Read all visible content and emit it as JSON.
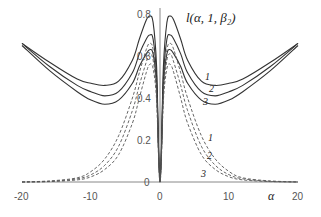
{
  "chart_data": {
    "type": "line",
    "xlabel": "α",
    "ylabel": "",
    "xlim": [
      -20,
      20
    ],
    "ylim": [
      0,
      0.8
    ],
    "x_ticks": [
      "-20",
      "-10",
      "0",
      "10",
      "20"
    ],
    "y_ticks": [
      "0",
      "0.2",
      "0.4",
      "0.6",
      "0.8"
    ],
    "grid": false,
    "legend": "inline curve numbers 1, 2, 3",
    "x": [
      -20,
      -16,
      -12,
      -10,
      -8,
      -6,
      -4,
      -3,
      -2,
      -1.5,
      -1,
      -0.5,
      0,
      0.5,
      1,
      1.5,
      2,
      3,
      4,
      6,
      8,
      10,
      12,
      16,
      20
    ],
    "series": [
      {
        "name": "1",
        "style": "solid",
        "values": [
          0.66,
          0.57,
          0.49,
          0.47,
          0.46,
          0.48,
          0.58,
          0.68,
          0.77,
          0.79,
          0.76,
          0.55,
          0.0,
          0.55,
          0.76,
          0.79,
          0.77,
          0.68,
          0.58,
          0.48,
          0.46,
          0.47,
          0.49,
          0.57,
          0.66
        ]
      },
      {
        "name": "2",
        "style": "solid",
        "values": [
          0.66,
          0.55,
          0.46,
          0.43,
          0.41,
          0.43,
          0.52,
          0.61,
          0.68,
          0.7,
          0.68,
          0.5,
          0.0,
          0.5,
          0.68,
          0.7,
          0.68,
          0.61,
          0.52,
          0.43,
          0.41,
          0.43,
          0.46,
          0.55,
          0.66
        ]
      },
      {
        "name": "3",
        "style": "solid",
        "values": [
          0.65,
          0.53,
          0.43,
          0.39,
          0.37,
          0.39,
          0.47,
          0.55,
          0.61,
          0.63,
          0.61,
          0.46,
          0.0,
          0.46,
          0.61,
          0.63,
          0.61,
          0.55,
          0.47,
          0.39,
          0.37,
          0.39,
          0.43,
          0.53,
          0.65
        ]
      },
      {
        "name": "1",
        "style": "dashed",
        "values": [
          0.0,
          0.005,
          0.02,
          0.05,
          0.11,
          0.22,
          0.4,
          0.52,
          0.63,
          0.66,
          0.63,
          0.45,
          0.0,
          0.45,
          0.63,
          0.66,
          0.63,
          0.52,
          0.4,
          0.22,
          0.11,
          0.05,
          0.02,
          0.005,
          0.0
        ]
      },
      {
        "name": "2",
        "style": "dashed",
        "values": [
          0.0,
          0.003,
          0.015,
          0.035,
          0.08,
          0.17,
          0.34,
          0.46,
          0.57,
          0.61,
          0.58,
          0.42,
          0.0,
          0.42,
          0.58,
          0.61,
          0.57,
          0.46,
          0.34,
          0.17,
          0.08,
          0.035,
          0.015,
          0.003,
          0.0
        ]
      },
      {
        "name": "3",
        "style": "dashed",
        "values": [
          0.0,
          0.002,
          0.01,
          0.025,
          0.06,
          0.13,
          0.28,
          0.4,
          0.52,
          0.56,
          0.54,
          0.39,
          0.0,
          0.39,
          0.54,
          0.56,
          0.52,
          0.4,
          0.28,
          0.13,
          0.06,
          0.025,
          0.01,
          0.002,
          0.0
        ]
      }
    ],
    "annotations": [
      {
        "text": "1",
        "near": "solid curve 1, right side",
        "x": 5.5,
        "y": 0.55
      },
      {
        "text": "2",
        "near": "solid curve 2, right side",
        "x": 6.0,
        "y": 0.47
      },
      {
        "text": "3",
        "near": "solid curve 3, right side",
        "x": 5.5,
        "y": 0.41
      },
      {
        "text": "1",
        "near": "dashed curve 1, right side",
        "x": 6.0,
        "y": 0.24
      },
      {
        "text": "2",
        "near": "dashed curve 2, right side",
        "x": 6.0,
        "y": 0.17
      },
      {
        "text": "3",
        "near": "dashed curve 3, right side",
        "x": 5.5,
        "y": 0.06
      }
    ],
    "colors": {
      "solid": "#333333",
      "dashed": "#555555",
      "axis": "#888888"
    }
  },
  "labels": {
    "title": "l(α, 1, β₂)",
    "x_axis": "α",
    "x_ticks": [
      "-20",
      "-10",
      "0",
      "10",
      "20"
    ],
    "y_ticks": [
      "0",
      "0.2",
      "0.4",
      "0.6",
      "0.8"
    ],
    "curve_numbers_solid": [
      "1",
      "2",
      "3"
    ],
    "curve_numbers_dashed": [
      "1",
      "2",
      "3"
    ]
  }
}
